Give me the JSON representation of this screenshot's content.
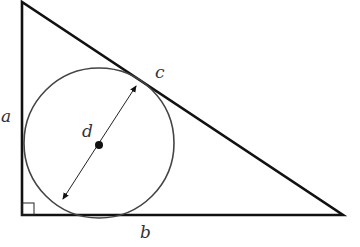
{
  "diagram": {
    "labels": {
      "a": "a",
      "b": "b",
      "c": "c",
      "d": "d"
    },
    "colors": {
      "triangle": "#111111",
      "circle": "#444444",
      "label": "#333333"
    }
  }
}
